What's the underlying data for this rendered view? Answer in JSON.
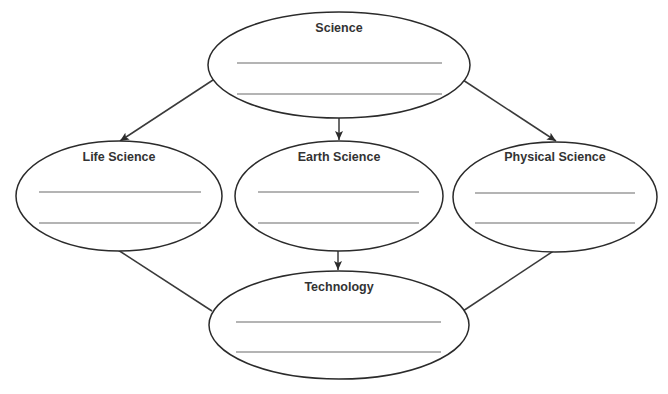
{
  "diagram": {
    "type": "concept-map",
    "nodes": [
      {
        "id": "science",
        "label": "Science",
        "blank_lines": 2
      },
      {
        "id": "life-science",
        "label": "Life Science",
        "blank_lines": 2
      },
      {
        "id": "earth-science",
        "label": "Earth Science",
        "blank_lines": 2
      },
      {
        "id": "physical-science",
        "label": "Physical Science",
        "blank_lines": 2
      },
      {
        "id": "technology",
        "label": "Technology",
        "blank_lines": 2
      }
    ],
    "edges": [
      {
        "from": "science",
        "to": "life-science",
        "arrow": true
      },
      {
        "from": "science",
        "to": "earth-science",
        "arrow": true
      },
      {
        "from": "science",
        "to": "physical-science",
        "arrow": true
      },
      {
        "from": "earth-science",
        "to": "technology",
        "arrow": true
      },
      {
        "from": "life-science",
        "to": "technology",
        "arrow": false
      },
      {
        "from": "physical-science",
        "to": "technology",
        "arrow": false
      }
    ],
    "colors": {
      "stroke": "#2b2b2b",
      "text": "#333333",
      "background": "#ffffff"
    }
  }
}
